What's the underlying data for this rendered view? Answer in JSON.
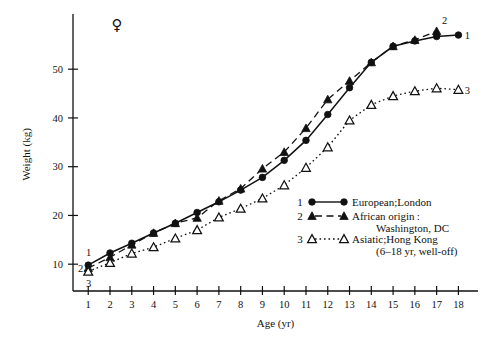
{
  "chart_data": {
    "type": "line",
    "title": "",
    "xlabel": "Age (yr)",
    "ylabel": "Weight (kg)",
    "xlim": [
      0.3,
      18.9
    ],
    "ylim": [
      4.5,
      60.5
    ],
    "xticks": [
      1,
      2,
      3,
      4,
      5,
      6,
      7,
      8,
      9,
      10,
      11,
      12,
      13,
      14,
      15,
      16,
      17,
      18
    ],
    "yticks": [
      10,
      20,
      30,
      40,
      50
    ],
    "grid": false,
    "legend_position": "inside-right",
    "sex_symbol": "♀",
    "x": [
      1,
      2,
      3,
      4,
      5,
      6,
      7,
      8,
      9,
      10,
      11,
      12,
      13,
      14,
      15,
      16,
      17,
      18
    ],
    "series": [
      {
        "name": "European;London",
        "number": "1",
        "marker": "filled-circle",
        "line": "solid",
        "x": [
          1,
          2,
          3,
          4,
          5,
          6,
          7,
          8,
          9,
          10,
          11,
          12,
          13,
          14,
          15,
          16,
          17,
          18
        ],
        "values": [
          9.8,
          12.3,
          14.3,
          16.4,
          18.4,
          20.6,
          22.8,
          25.2,
          27.8,
          31.3,
          35.4,
          40.7,
          46.2,
          51.4,
          54.7,
          55.8,
          56.7,
          57.0
        ]
      },
      {
        "name": "African origin: Washington, DC",
        "number": "2",
        "marker": "filled-triangle",
        "line": "dashed",
        "x": [
          1,
          2,
          3,
          4,
          5,
          6,
          7,
          8,
          9,
          10,
          11,
          12,
          13,
          14,
          15,
          16,
          17
        ],
        "values": [
          9.2,
          11.4,
          14.0,
          16.4,
          18.4,
          19.5,
          23.0,
          25.5,
          29.6,
          33.0,
          37.9,
          43.8,
          47.6,
          51.4,
          54.7,
          56.0,
          57.8
        ]
      },
      {
        "name": "Asiatic;Hong Kong (6-18 yr, well-off)",
        "number": "3",
        "marker": "open-triangle",
        "line": "dotted",
        "x": [
          1,
          2,
          3,
          4,
          5,
          6,
          7,
          8,
          9,
          10,
          11,
          12,
          13,
          14,
          15,
          16,
          17,
          18
        ],
        "values": [
          8.5,
          10.3,
          12.2,
          13.5,
          15.3,
          17.0,
          19.6,
          21.4,
          23.5,
          26.2,
          29.8,
          34.0,
          39.5,
          42.7,
          44.5,
          45.5,
          46.1,
          45.8
        ]
      }
    ],
    "endpoint_labels": [
      "1",
      "2",
      "3"
    ],
    "start_labels": [
      "1",
      "2",
      "3"
    ]
  },
  "legend": {
    "entries": [
      {
        "number": "1",
        "line1": "European;London",
        "line2": ""
      },
      {
        "number": "2",
        "line1": "African origin :",
        "line2": "Washington, DC"
      },
      {
        "number": "3",
        "line1": "Asiatic;Hong Kong",
        "line2": "(6–18 yr, well-off)"
      }
    ]
  },
  "axes": {
    "xlabel": "Age (yr)",
    "ylabel": "Weight (kg)",
    "xtick_labels": [
      "1",
      "2",
      "3",
      "4",
      "5",
      "6",
      "7",
      "8",
      "9",
      "10",
      "11",
      "12",
      "13",
      "14",
      "15",
      "16",
      "17",
      "18"
    ],
    "ytick_labels": [
      "10",
      "20",
      "30",
      "40",
      "50"
    ]
  },
  "annotations": {
    "sex_symbol": "♀"
  },
  "colors": {
    "ink": "#111111",
    "background": "#ffffff"
  }
}
